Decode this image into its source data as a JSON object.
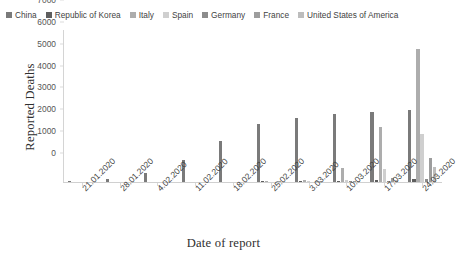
{
  "chart_data": {
    "type": "bar",
    "title": "",
    "xlabel": "Date of report",
    "ylabel": "Reported Deaths",
    "ylim": [
      0,
      7000
    ],
    "yticks": [
      0,
      1000,
      2000,
      3000,
      4000,
      5000,
      6000,
      7000
    ],
    "grid": false,
    "legend_position": "top",
    "categories": [
      "21.01.2020",
      "28.01.2020",
      "4.02.2020",
      "11.02.2020",
      "18.02.2020",
      "25.02.2020",
      "3.03.2020",
      "10.03.2020",
      "17.03.2020",
      "24.03.2020"
    ],
    "series": [
      {
        "name": "China",
        "color": "#7a7a7a",
        "values": [
          17,
          132,
          425,
          1016,
          1868,
          2663,
          2945,
          3123,
          3226,
          3277
        ]
      },
      {
        "name": "Republic of Korea",
        "color": "#5e5e5e",
        "values": [
          0,
          0,
          0,
          0,
          0,
          12,
          35,
          54,
          84,
          126
        ]
      },
      {
        "name": "Italy",
        "color": "#adadad",
        "values": [
          0,
          0,
          0,
          0,
          0,
          11,
          107,
          631,
          2503,
          6077
        ]
      },
      {
        "name": "Spain",
        "color": "#cfcfcf",
        "values": [
          0,
          0,
          0,
          0,
          0,
          0,
          3,
          84,
          598,
          2182
        ]
      },
      {
        "name": "Germany",
        "color": "#8c8c8c",
        "values": [
          0,
          0,
          0,
          0,
          0,
          0,
          0,
          2,
          28,
          123
        ]
      },
      {
        "name": "France",
        "color": "#9d9d9d",
        "values": [
          0,
          0,
          0,
          0,
          0,
          2,
          4,
          33,
          175,
          1100
        ]
      },
      {
        "name": "United States of America",
        "color": "#bdbdbd",
        "values": [
          0,
          0,
          0,
          0,
          0,
          0,
          9,
          28,
          108,
          706
        ]
      }
    ]
  },
  "legend": {
    "items": [
      {
        "label": "China"
      },
      {
        "label": "Republic of Korea"
      },
      {
        "label": "Italy"
      },
      {
        "label": "Spain"
      },
      {
        "label": "Germany"
      },
      {
        "label": "France"
      },
      {
        "label": "United States of America"
      }
    ]
  }
}
